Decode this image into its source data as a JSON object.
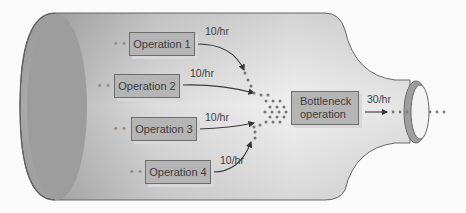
{
  "diagram": {
    "type": "bottleneck illustration",
    "operations": [
      {
        "label": "Operation 1",
        "rate": "10/hr"
      },
      {
        "label": "Operation 2",
        "rate": "10/hr"
      },
      {
        "label": "Operation 3",
        "rate": "10/hr"
      },
      {
        "label": "Operation 4",
        "rate": "10/hr"
      }
    ],
    "bottleneck": {
      "label": "Bottleneck\noperation",
      "output_rate": "30/hr"
    },
    "lead_dots": "• •",
    "colors": {
      "bottle_dark": "#9a9a9a",
      "bottle_light": "#f2f2f2",
      "box_fill": "#b5b5b5",
      "box_border": "#6e6e6e",
      "text": "#3c3c3c",
      "dots": "#777777"
    }
  }
}
